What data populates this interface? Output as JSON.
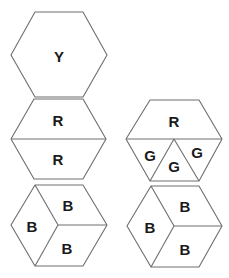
{
  "hexagons": {
    "top": {
      "label": "Y"
    },
    "middle_left": {
      "labels": [
        "R",
        "R"
      ]
    },
    "middle_right": {
      "labels": [
        "R",
        "G",
        "G",
        "G"
      ]
    },
    "bottom_left": {
      "labels": [
        "B",
        "B",
        "B"
      ]
    },
    "bottom_right": {
      "labels": [
        "B",
        "B",
        "B"
      ]
    }
  },
  "colors": {
    "stroke": "#6e6e6e",
    "text": "#1a1a1a",
    "background": "#ffffff"
  }
}
